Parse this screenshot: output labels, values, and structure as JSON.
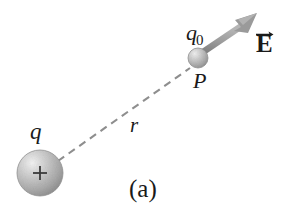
{
  "figure": {
    "caption": "(a)",
    "background_color": "#ffffff",
    "width": 289,
    "height": 217,
    "labels": {
      "source_charge": "q",
      "test_charge": "q",
      "test_charge_subscript": "0",
      "point": "P",
      "distance": "r",
      "field_vector": "E"
    },
    "elements": {
      "source_sphere": {
        "name": "positive-source-charge-sphere",
        "center_x": 40,
        "center_y": 173,
        "radius": 23,
        "sign": "+",
        "fill_color": "#b6b6b6",
        "highlight_color": "#e8e8e8"
      },
      "test_sphere": {
        "name": "test-charge-sphere",
        "center_x": 198,
        "center_y": 58,
        "radius": 10,
        "fill_color": "#b6b6b6",
        "highlight_color": "#e6e6e6"
      },
      "distance_line": {
        "name": "distance-dashed-line",
        "x1": 58,
        "y1": 161,
        "x2": 190,
        "y2": 68,
        "style": "dashed",
        "color": "#8e8e8e"
      },
      "field_arrow": {
        "name": "electric-field-arrow",
        "x1": 204,
        "y1": 51,
        "x2": 256,
        "y2": 15,
        "color": "#949494",
        "shaft_width": 6
      }
    }
  }
}
